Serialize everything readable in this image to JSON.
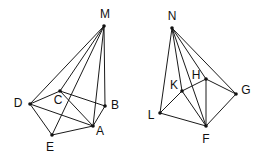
{
  "diagram": {
    "type": "geometry-pyramids",
    "figures": [
      {
        "id": "pyramid-M",
        "apex": "M",
        "base": [
          "D",
          "C",
          "B",
          "A",
          "E"
        ],
        "vertices": [
          {
            "name": "M",
            "x": 104,
            "y": 26,
            "lx": 105,
            "ly": 15
          },
          {
            "name": "C",
            "x": 60,
            "y": 91,
            "lx": 58,
            "ly": 101
          },
          {
            "name": "D",
            "x": 30,
            "y": 104,
            "lx": 18,
            "ly": 104
          },
          {
            "name": "B",
            "x": 105,
            "y": 106,
            "lx": 115,
            "ly": 106
          },
          {
            "name": "A",
            "x": 93,
            "y": 126,
            "lx": 100,
            "ly": 132
          },
          {
            "name": "E",
            "x": 52,
            "y": 135,
            "lx": 50,
            "ly": 148
          }
        ],
        "edges": [
          [
            "M",
            "D"
          ],
          [
            "M",
            "C"
          ],
          [
            "M",
            "E"
          ],
          [
            "M",
            "A"
          ],
          [
            "M",
            "B"
          ],
          [
            "D",
            "C"
          ],
          [
            "C",
            "B"
          ],
          [
            "B",
            "A"
          ],
          [
            "A",
            "E"
          ],
          [
            "E",
            "D"
          ],
          [
            "D",
            "A"
          ],
          [
            "C",
            "A"
          ]
        ]
      },
      {
        "id": "pyramid-N",
        "apex": "N",
        "base": [
          "L",
          "K",
          "H",
          "G",
          "F"
        ],
        "vertices": [
          {
            "name": "N",
            "x": 172,
            "y": 28,
            "lx": 172,
            "ly": 17
          },
          {
            "name": "H",
            "x": 206,
            "y": 79,
            "lx": 196,
            "ly": 76
          },
          {
            "name": "K",
            "x": 182,
            "y": 91,
            "lx": 174,
            "ly": 86
          },
          {
            "name": "G",
            "x": 236,
            "y": 94,
            "lx": 246,
            "ly": 91
          },
          {
            "name": "L",
            "x": 160,
            "y": 113,
            "lx": 151,
            "ly": 116
          },
          {
            "name": "F",
            "x": 206,
            "y": 126,
            "lx": 206,
            "ly": 140
          }
        ],
        "edges": [
          [
            "N",
            "L"
          ],
          [
            "N",
            "K"
          ],
          [
            "N",
            "F"
          ],
          [
            "N",
            "H"
          ],
          [
            "N",
            "G"
          ],
          [
            "L",
            "K"
          ],
          [
            "K",
            "H"
          ],
          [
            "H",
            "G"
          ],
          [
            "G",
            "F"
          ],
          [
            "F",
            "L"
          ],
          [
            "K",
            "F"
          ],
          [
            "H",
            "F"
          ]
        ]
      }
    ]
  }
}
